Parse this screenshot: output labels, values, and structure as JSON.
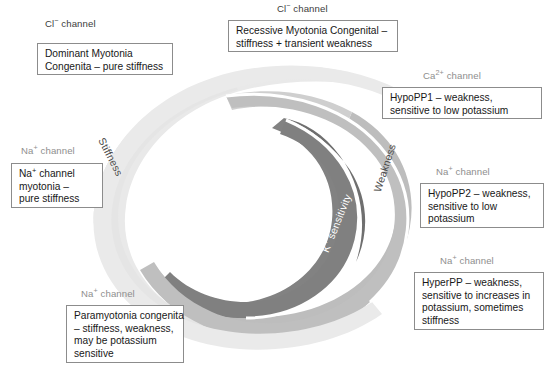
{
  "diagram": {
    "colors": {
      "outer_band": "#e9e9e9",
      "mid_band": "#bdbdbd",
      "inner_band": "#828282",
      "box_border": "#8c8c8c",
      "caption_gray": "#8e8e8e",
      "caption_dark": "#3b3b3b",
      "background": "#ffffff"
    },
    "bands": [
      {
        "id": "stiffness",
        "label": "Stiffness",
        "shade": "light",
        "text_color": "#4a4a4a"
      },
      {
        "id": "weakness",
        "label": "Weakness",
        "shade": "medium",
        "text_color": "#4a4a4a"
      },
      {
        "id": "k_sensitivity",
        "label": "K+ sensitivity",
        "label_main": "K",
        "label_sup": "+",
        "label_rest": " sensitivity",
        "shade": "dark",
        "text_color": "#ffffff"
      }
    ],
    "entries": [
      {
        "id": "dominant-myotonia-congenita",
        "channel_main": "Cl",
        "channel_sup": "−",
        "channel_rest": " channel",
        "channel_tone": "dark",
        "lines": [
          "Dominant Myotonia",
          "Congenita – pure stiffness"
        ]
      },
      {
        "id": "recessive-myotonia-congenital",
        "channel_main": "Cl",
        "channel_sup": "−",
        "channel_rest": " channel",
        "channel_tone": "dark",
        "lines": [
          "Recessive Myotonia Congenital –",
          "stiffness + transient weakness"
        ]
      },
      {
        "id": "hypopp1",
        "channel_main": "Ca",
        "channel_sup": "2+",
        "channel_rest": " channel",
        "channel_tone": "gray",
        "lines": [
          "HypoPP1 – weakness,",
          "sensitive to low potassium"
        ]
      },
      {
        "id": "na-channel-myotonia",
        "channel_main": "Na",
        "channel_sup": "+",
        "channel_rest": " channel",
        "channel_tone": "gray",
        "lines": [
          "Na⁺ channel",
          "myotonia –",
          "pure stiffness"
        ],
        "line1_main": "Na",
        "line1_sup": "+",
        "line1_rest": " channel"
      },
      {
        "id": "hypopp2",
        "channel_main": "Na",
        "channel_sup": "+",
        "channel_rest": " channel",
        "channel_tone": "gray",
        "lines": [
          "HypoPP2 – weakness,",
          "sensitive to low",
          "potassium"
        ]
      },
      {
        "id": "hyperpp",
        "channel_main": "Na",
        "channel_sup": "+",
        "channel_rest": " channel",
        "channel_tone": "gray",
        "lines": [
          "HyperPP – weakness,",
          "sensitive to increases in",
          "potassium, sometimes",
          "stiffness"
        ]
      },
      {
        "id": "paramyotonia-congenita",
        "channel_main": "Na",
        "channel_sup": "+",
        "channel_rest": " channel",
        "channel_tone": "gray",
        "lines": [
          "Paramyotonia congenita",
          "– stiffness, weakness,",
          "may be potassium",
          "sensitive"
        ]
      }
    ]
  }
}
